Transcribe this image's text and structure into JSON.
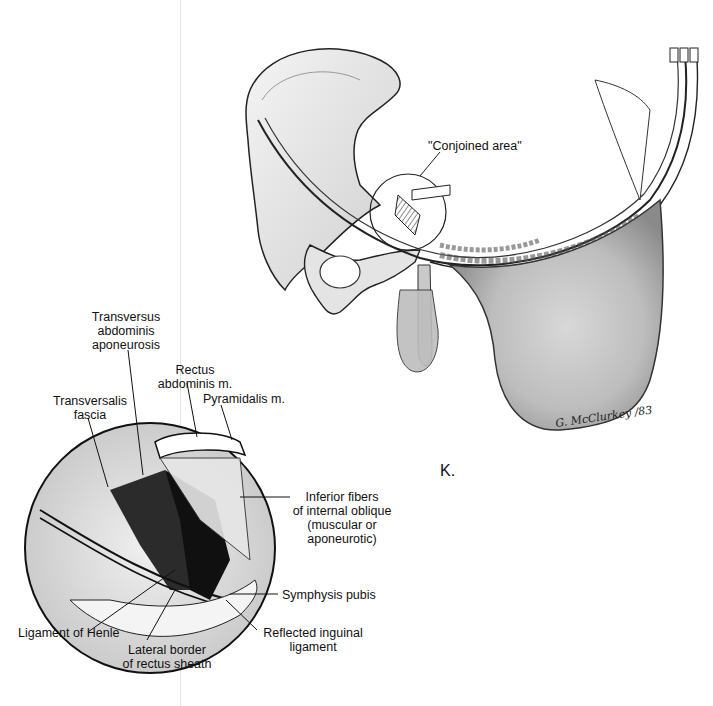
{
  "figure": {
    "panel_letter": "K.",
    "signature": "G. McClurkey /83",
    "main_view": {
      "description": "Anterior oblique view of pelvis and lower abdominal wall layers with circled region",
      "callout": "\"Conjoined area\""
    },
    "inset_view": {
      "description": "Magnified circular inset of the conjoined area",
      "labels": {
        "transversus_line1": "Transversus",
        "transversus_line2": "abdominis",
        "transversus_line3": "aponeurosis",
        "rectus_line1": "Rectus",
        "rectus_line2": "abdominis m.",
        "pyramidalis": "Pyramidalis m.",
        "transversalis_line1": "Transversalis",
        "transversalis_line2": "fascia",
        "inferior_line1": "Inferior fibers",
        "inferior_line2": "of internal oblique",
        "inferior_line3": "(muscular or",
        "inferior_line4": "aponeurotic)",
        "symphysis": "Symphysis pubis",
        "henle": "Ligament of Henle",
        "lateral_line1": "Lateral border",
        "lateral_line2": "of rectus sheath",
        "reflected_line1": "Reflected inguinal",
        "reflected_line2": "ligament"
      }
    }
  }
}
